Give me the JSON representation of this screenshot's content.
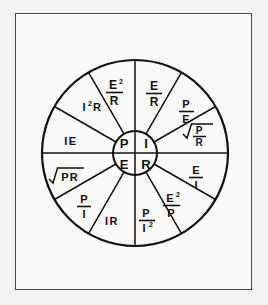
{
  "diagram": {
    "geometry": {
      "center_x": 135,
      "center_y": 153,
      "outer_radius": 93,
      "hub_radius": 22,
      "sector_count": 12,
      "sector_span_degrees": 30
    },
    "colors": {
      "background": "#f4f3f1",
      "paper": "#fbfaf9",
      "ink": "#111111",
      "frame": "#4a4a4a"
    },
    "hub": {
      "quadrants": [
        {
          "id": "hub-p",
          "label": "P",
          "position": "top-left"
        },
        {
          "id": "hub-i",
          "label": "I",
          "position": "top-right"
        },
        {
          "id": "hub-e",
          "label": "E",
          "position": "bottom-left"
        },
        {
          "id": "hub-r",
          "label": "R",
          "position": "bottom-right"
        }
      ]
    },
    "sectors": [
      {
        "id": "sector-e2-over-r",
        "quantity": "P",
        "type": "fraction",
        "numerator": "E",
        "numerator_exponent": "2",
        "denominator": "R",
        "text": "E2/R",
        "start_deg": 240,
        "end_deg": 270
      },
      {
        "id": "sector-i2r",
        "quantity": "P",
        "type": "product",
        "text": "I2R",
        "base": "I",
        "exponent": "2",
        "factor": "R",
        "start_deg": 210,
        "end_deg": 240
      },
      {
        "id": "sector-ie",
        "quantity": "P",
        "type": "product",
        "text": "IE",
        "factors": "I E",
        "start_deg": 180,
        "end_deg": 210
      },
      {
        "id": "sector-sqrt-pr",
        "quantity": "E",
        "type": "radical",
        "text": "sqrt(PR)",
        "radicand": "PR",
        "start_deg": 150,
        "end_deg": 180
      },
      {
        "id": "sector-p-over-i",
        "quantity": "E",
        "type": "fraction",
        "numerator": "P",
        "denominator": "I",
        "text": "P/I",
        "start_deg": 120,
        "end_deg": 150
      },
      {
        "id": "sector-ir",
        "quantity": "E",
        "type": "product",
        "text": "IR",
        "factors": "I R",
        "start_deg": 90,
        "end_deg": 120
      },
      {
        "id": "sector-p-over-i2",
        "quantity": "R",
        "type": "fraction",
        "numerator": "P",
        "denominator": "I",
        "denominator_exponent": "2",
        "text": "P/I2",
        "start_deg": 60,
        "end_deg": 90
      },
      {
        "id": "sector-e2-over-p",
        "quantity": "R",
        "type": "fraction",
        "numerator": "E",
        "numerator_exponent": "2",
        "denominator": "P",
        "text": "E2/P",
        "start_deg": 30,
        "end_deg": 60
      },
      {
        "id": "sector-e-over-i",
        "quantity": "R",
        "type": "fraction",
        "numerator": "E",
        "denominator": "I",
        "text": "E/I",
        "start_deg": 0,
        "end_deg": 30
      },
      {
        "id": "sector-sqrt-p-over-r",
        "quantity": "I",
        "type": "radical-fraction",
        "numerator": "P",
        "denominator": "R",
        "text": "sqrt(P/R)",
        "start_deg": 330,
        "end_deg": 360
      },
      {
        "id": "sector-p-over-e",
        "quantity": "I",
        "type": "fraction",
        "numerator": "P",
        "denominator": "E",
        "text": "P/E",
        "start_deg": 300,
        "end_deg": 330
      },
      {
        "id": "sector-e-over-r",
        "quantity": "I",
        "type": "fraction",
        "numerator": "E",
        "denominator": "R",
        "text": "E/R",
        "start_deg": 270,
        "end_deg": 300
      }
    ]
  }
}
